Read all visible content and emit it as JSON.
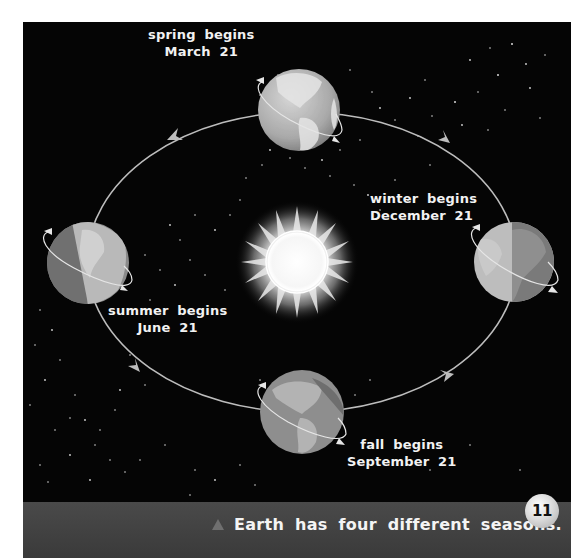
{
  "diagram": {
    "colors": {
      "space": "#050505",
      "orbit": "#bdbdbd",
      "caption_band": "#414141",
      "sun_core": "#ffffff",
      "earth_light": "#c9c9c9",
      "earth_dark": "#7d7d7d",
      "page_bg": "#ffffff"
    },
    "center_object": {
      "name": "Sun"
    },
    "seasons": [
      {
        "id": "spring",
        "line1": "spring begins",
        "line2": "March 21",
        "position": "top"
      },
      {
        "id": "winter",
        "line1": "winter begins",
        "line2": "December 21",
        "position": "right"
      },
      {
        "id": "summer",
        "line1": "summer begins",
        "line2": "June 21",
        "position": "left"
      },
      {
        "id": "fall",
        "line1": "fall begins",
        "line2": "September 21",
        "position": "bottom"
      }
    ],
    "orbit_direction": "counterclockwise"
  },
  "caption": {
    "marker_icon": "triangle-icon",
    "text": "Earth has four different seasons."
  },
  "page_number": "11"
}
